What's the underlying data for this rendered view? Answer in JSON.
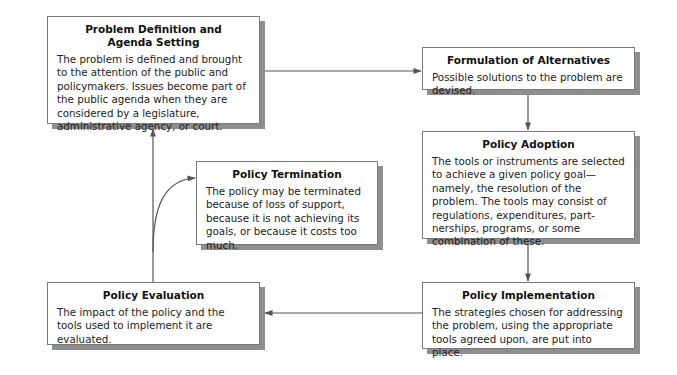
{
  "diagram": {
    "type": "policy-process-cycle",
    "stages": [
      {
        "id": "problem_definition",
        "title_line1": "Problem Definition and",
        "title_line2": "Agenda Setting",
        "body": "The problem is defined and brought to the attention of the public and policymakers. Issues become part of the public agenda when they are considered by a legislature, administrative agency, or court."
      },
      {
        "id": "formulation",
        "title": "Formulation of Alternatives",
        "body": "Possible solutions to the problem are devised."
      },
      {
        "id": "adoption",
        "title": "Policy Adoption",
        "body": "The tools or instruments are selected to achieve a given policy goal—namely, the resolution of the problem. The tools may consist of regulations, expenditures, part-nerships, programs, or some combination of these."
      },
      {
        "id": "implementation",
        "title": "Policy Implementation",
        "body": "The strategies chosen for addressing the problem, using the appropriate tools agreed upon, are put into place."
      },
      {
        "id": "evaluation",
        "title": "Policy Evaluation",
        "body": "The impact of the policy and the tools used to implement it are evaluated."
      },
      {
        "id": "termination",
        "title": "Policy Termination",
        "body": "The policy may be terminated because of loss of support, because it is not achieving its goals, or because it costs too much."
      }
    ],
    "edges": [
      {
        "from": "problem_definition",
        "to": "formulation"
      },
      {
        "from": "formulation",
        "to": "adoption"
      },
      {
        "from": "adoption",
        "to": "implementation"
      },
      {
        "from": "implementation",
        "to": "evaluation"
      },
      {
        "from": "evaluation",
        "to": "problem_definition"
      },
      {
        "from": "evaluation",
        "to": "termination"
      }
    ],
    "colors": {
      "line": "#555555",
      "border": "#7a7a7a",
      "shadow": "#8e8e8e",
      "box_fill": "#ffffff"
    }
  }
}
